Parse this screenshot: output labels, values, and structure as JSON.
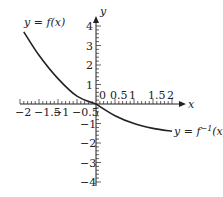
{
  "chart_data": {
    "type": "line",
    "title": "",
    "xlabel": "x",
    "ylabel": "y",
    "xlim": [
      -2,
      2
    ],
    "ylim": [
      -4,
      4
    ],
    "x_ticks": [
      "-2",
      "-1.5",
      "-1",
      "-0.5",
      "0",
      "0.5",
      "1",
      "1.5",
      "2"
    ],
    "y_ticks": [
      "4",
      "3",
      "2",
      "1",
      "-1",
      "-2",
      "-3",
      "-4"
    ],
    "series": [
      {
        "name": "y = f(x)",
        "points": [
          [
            -1.9,
            3.7
          ],
          [
            -1.5,
            2.5
          ],
          [
            -1,
            1.3
          ],
          [
            -0.5,
            0.4
          ],
          [
            0,
            0
          ]
        ]
      },
      {
        "name": "y = f^-1(x)",
        "points": [
          [
            0,
            0
          ],
          [
            0.5,
            -0.6
          ],
          [
            1,
            -1.0
          ],
          [
            1.5,
            -1.25
          ],
          [
            2,
            -1.4
          ]
        ]
      }
    ],
    "grid": false
  },
  "labels": {
    "f": "y = f(x)",
    "finv": "y = f",
    "finv_sup": "−1",
    "finv_tail": "(x)",
    "x": "x",
    "y": "y",
    "zero": "0"
  }
}
